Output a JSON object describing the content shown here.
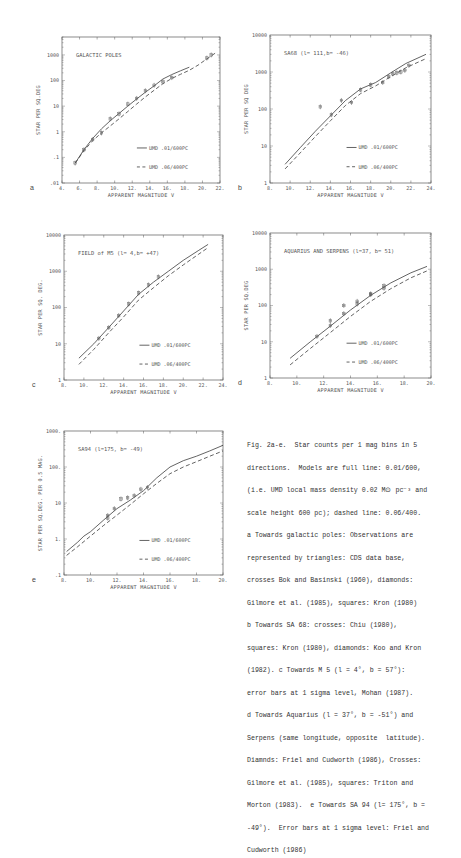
{
  "figure": {
    "caption_lines": [
      "Fig. 2a-e.  Star counts per 1 mag bins in 5",
      "directions.  Models are full line: 0.01/600,",
      "(i.e. UMD local mass density 0.02 M⊙ pc⁻³ and",
      "scale height 600 pc); dashed line: 0.06/400.",
      "a Towards galactic poles: Observations are",
      "represented by triangles: CDS data base,",
      "crosses Bok and Basinski (1960), diamonds:",
      "Gilmore et al. (1985), squares: Kron (1980)",
      "b Towards SA 68: crosses: Chiu (1980),",
      "squares: Kron (1980), diamonds: Koo and Kron",
      "(1982). c Towards M 5 (l = 4°, b = 57°):",
      "error bars at 1 sigma level, Mohan (1987).",
      "d Towards Aquarius (l = 37°, b = -51°) and",
      "Serpens (same longitude, opposite  latitude).",
      "Diamnds: Friel and Cudworth (1986), Crosses:",
      "Gilmore et al. (1985), squares: Triton and",
      "Morton (1983).  e Towards SA 94 (l= 175°, b =",
      "-49°).  Error bars at 1 sigma level: Friel and",
      "Cudworth (1986)"
    ]
  },
  "legend": {
    "solid_label": "UMD  .01/600PC",
    "dashed_label": "UMD  .06/400PC"
  },
  "chart_data": [
    {
      "panel": "a",
      "type": "line",
      "title": "GALACTIC POLES",
      "xlabel": "APPARENT MAGNITUDE  V",
      "ylabel": "STAR PER SQ.DEG",
      "xlim": [
        4,
        22
      ],
      "ylim_log": [
        0.01,
        5000
      ],
      "xticks": [
        4,
        6,
        8,
        10,
        12,
        14,
        16,
        18,
        20,
        22
      ],
      "yticks": [
        0.01,
        0.1,
        1,
        10,
        100,
        1000
      ],
      "ytick_labels": [
        ".01",
        ".1",
        "1",
        "10",
        "100",
        "1000"
      ],
      "frame": [
        62,
        37,
        220,
        183
      ],
      "series": [
        {
          "name": "UMD .01/600PC",
          "style": "solid",
          "x": [
            5.5,
            6.5,
            7.5,
            8.5,
            9.5,
            10.5,
            11.5,
            12.5,
            13.5,
            14.5,
            15.5,
            16.5,
            17.5,
            18.5
          ],
          "y": [
            0.06,
            0.2,
            0.55,
            1.3,
            2.7,
            5.2,
            10,
            19,
            35,
            62,
            115,
            170,
            240,
            330
          ]
        },
        {
          "name": "UMD .06/400PC",
          "style": "dashed",
          "x": [
            5.5,
            6.5,
            7.5,
            8.5,
            9.5,
            10.5,
            11.5,
            12.5,
            13.5,
            14.5,
            15.5,
            16.5,
            17.5,
            18.5,
            19.5,
            20.5,
            21.5
          ],
          "y": [
            0.06,
            0.18,
            0.45,
            0.9,
            1.7,
            3.2,
            6.2,
            12,
            23,
            42,
            75,
            120,
            175,
            250,
            400,
            700,
            1200
          ]
        },
        {
          "name": "observations",
          "style": "markers",
          "x": [
            5.5,
            6.5,
            7.5,
            8.5,
            9.5,
            10.5,
            11.5,
            12.5,
            13.5,
            14.5,
            15.5,
            16.5,
            20.5,
            21.0
          ],
          "y": [
            0.06,
            0.2,
            0.5,
            0.9,
            3.2,
            5,
            12,
            20,
            40,
            65,
            90,
            130,
            750,
            1000
          ]
        }
      ]
    },
    {
      "panel": "b",
      "type": "line",
      "title": "SA68   (l= 111,b= -46)",
      "xlabel": "APPARENT MAGNITUDE  V",
      "ylabel": "STAR PER SQ DEG",
      "xlim": [
        8,
        24
      ],
      "ylim_log": [
        1,
        10000
      ],
      "xticks": [
        8,
        10,
        12,
        14,
        16,
        18,
        20,
        22,
        24
      ],
      "yticks": [
        1,
        10,
        100,
        1000,
        10000
      ],
      "ytick_labels": [
        "1",
        "10",
        "100",
        "1000",
        "10000"
      ],
      "frame": [
        270,
        35,
        431,
        183
      ],
      "series": [
        {
          "name": "UMD .01/600PC",
          "style": "solid",
          "x": [
            9.5,
            11,
            12.5,
            14,
            15.5,
            17,
            18.5,
            20,
            21.5,
            23.5
          ],
          "y": [
            3.2,
            9,
            25,
            65,
            170,
            350,
            520,
            950,
            1700,
            3000
          ]
        },
        {
          "name": "UMD .06/400PC",
          "style": "dashed",
          "x": [
            9.5,
            11,
            12.5,
            14,
            15.5,
            17,
            18.5,
            20,
            21.5,
            23.5
          ],
          "y": [
            2.4,
            6.5,
            18,
            48,
            125,
            260,
            420,
            750,
            1300,
            2300
          ]
        },
        {
          "name": "observations",
          "style": "markers",
          "x": [
            13,
            14.1,
            15.1,
            16.1,
            17,
            18,
            19.2,
            19.8,
            20.2,
            20.6,
            21,
            21.4,
            21.8
          ],
          "y": [
            115,
            70,
            170,
            150,
            330,
            450,
            520,
            750,
            900,
            950,
            1000,
            1100,
            1500
          ]
        }
      ]
    },
    {
      "panel": "c",
      "type": "line",
      "title": "FIELD of M5 (l= 4,b= +47)",
      "xlabel": "APPARENT MAGNITUDE V",
      "ylabel": "STAR PER SQ. DEG.",
      "xlim": [
        8,
        24
      ],
      "ylim_log": [
        1,
        10000
      ],
      "xticks": [
        8,
        10,
        12,
        14,
        16,
        18,
        20,
        22,
        24
      ],
      "yticks": [
        1,
        10,
        100,
        1000,
        10000
      ],
      "ytick_labels": [
        "1",
        "10",
        "100",
        "1000",
        "10000"
      ],
      "frame": [
        64,
        235,
        223,
        380
      ],
      "series": [
        {
          "name": "UMD .01/600PC",
          "style": "solid",
          "x": [
            9.5,
            11,
            12.5,
            14,
            15.5,
            17,
            18.5,
            20,
            21.5,
            22.5
          ],
          "y": [
            4,
            10,
            28,
            80,
            230,
            500,
            1000,
            2000,
            3700,
            5500
          ]
        },
        {
          "name": "UMD .06/400PC",
          "style": "dashed",
          "x": [
            9.5,
            11,
            12.5,
            14,
            15.5,
            17,
            18.5,
            20,
            21.5,
            22.5
          ],
          "y": [
            2.7,
            7,
            20,
            55,
            160,
            350,
            750,
            1500,
            2900,
            4500
          ]
        },
        {
          "name": "observations",
          "style": "markers",
          "x": [
            11.5,
            12.5,
            13.5,
            14.5,
            15.5,
            16.5,
            17.5
          ],
          "y": [
            14,
            28,
            60,
            125,
            250,
            420,
            700
          ]
        }
      ]
    },
    {
      "panel": "d",
      "type": "line",
      "title": "AQUARIUS AND SERPENS (l=37, b= 51)",
      "xlabel": "APPARENT MAGNITUDE  V",
      "ylabel": "STAR PER SQ.DEG",
      "xlim": [
        8,
        20
      ],
      "ylim_log": [
        1,
        10000
      ],
      "xticks": [
        8,
        10,
        12,
        14,
        16,
        18,
        20
      ],
      "yticks": [
        1,
        10,
        100,
        1000,
        10000
      ],
      "ytick_labels": [
        "1",
        "10",
        "100",
        "1000",
        "10000"
      ],
      "frame": [
        270,
        233,
        431,
        378
      ],
      "series": [
        {
          "name": "UMD .01/600PC",
          "style": "solid",
          "x": [
            9.5,
            11,
            12.5,
            14,
            15.5,
            17,
            18.5,
            19.7
          ],
          "y": [
            3.5,
            10,
            27,
            75,
            190,
            420,
            800,
            1200
          ]
        },
        {
          "name": "UMD .06/400PC",
          "style": "dashed",
          "x": [
            9.5,
            11,
            12.5,
            14,
            15.5,
            17,
            18.5,
            19.7
          ],
          "y": [
            2.3,
            6.5,
            18,
            50,
            130,
            290,
            580,
            900
          ]
        },
        {
          "name": "observations",
          "style": "markers",
          "x": [
            11.5,
            12.5,
            12.5,
            13.5,
            13.5,
            14.5,
            14.5,
            15.5,
            15.5,
            16.5,
            16.5
          ],
          "y": [
            14,
            28,
            38,
            60,
            100,
            110,
            130,
            200,
            210,
            300,
            350
          ]
        }
      ]
    },
    {
      "panel": "e",
      "type": "line",
      "title": "SA94  (l=175, b= -49)",
      "xlabel": "APPARENT MAGNITUDE  V",
      "ylabel": "STAR PER SQ.DEG. PER 0.5 MAG.",
      "xlim": [
        8,
        20
      ],
      "ylim_log": [
        0.1,
        1000
      ],
      "xticks": [
        8,
        10,
        12,
        14,
        16,
        18,
        20
      ],
      "yticks": [
        0.1,
        1,
        10,
        100,
        1000
      ],
      "ytick_labels": [
        ".1",
        "1.",
        "10",
        "100.",
        "1000."
      ],
      "frame": [
        64,
        431,
        223,
        575
      ],
      "series": [
        {
          "name": "UMD .01/600PC",
          "style": "solid",
          "x": [
            8.2,
            9,
            9.5,
            10,
            11,
            12,
            13,
            14,
            15,
            16,
            17,
            18,
            19,
            20
          ],
          "y": [
            0.45,
            0.8,
            1.2,
            1.6,
            3.4,
            7,
            12,
            22,
            50,
            100,
            150,
            200,
            280,
            400
          ]
        },
        {
          "name": "UMD .06/400PC",
          "style": "dashed",
          "x": [
            8.2,
            9,
            10,
            11,
            12,
            13,
            14,
            15,
            16,
            17,
            18,
            19,
            20
          ],
          "y": [
            0.35,
            0.6,
            1.2,
            2.4,
            4.6,
            9,
            18,
            35,
            65,
            100,
            140,
            200,
            280
          ]
        },
        {
          "name": "observations",
          "style": "markers",
          "x": [
            11.3,
            11.3,
            11.8,
            12.3,
            12.8,
            13.3,
            13.8,
            14.3
          ],
          "y": [
            4.5,
            3.8,
            7,
            13,
            14,
            16,
            24,
            27
          ]
        }
      ]
    }
  ]
}
